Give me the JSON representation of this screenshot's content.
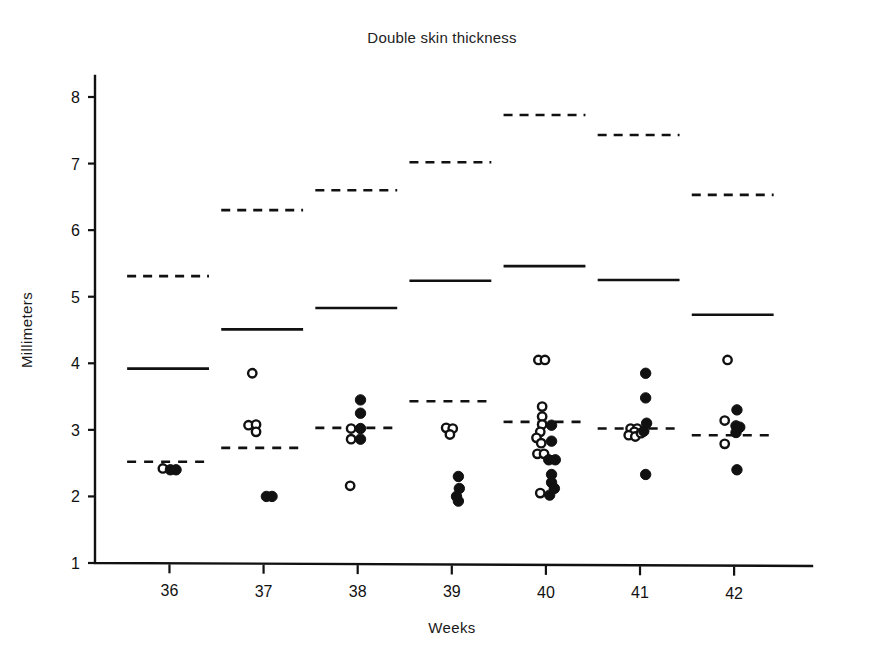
{
  "chart_data": {
    "type": "scatter",
    "title": "Double skin thickness",
    "xlabel": "Weeks",
    "ylabel": "Millimeters",
    "xlim": [
      35.4,
      42.7
    ],
    "ylim": [
      1,
      8.4
    ],
    "grid": false,
    "legend": "none",
    "x_ticks": [
      36,
      37,
      38,
      39,
      40,
      41,
      42
    ],
    "x_tick_labels": [
      "36",
      "37",
      "38",
      "39",
      "40",
      "41",
      "42"
    ],
    "y_ticks": [
      1,
      2,
      3,
      4,
      5,
      6,
      7,
      8
    ],
    "y_tick_labels": [
      "1",
      "2",
      "3",
      "4",
      "5",
      "6",
      "7",
      "8"
    ],
    "marker_types": [
      "open-circle",
      "filled-circle"
    ],
    "series": [
      {
        "name": "open-circle",
        "marker": "open-circle",
        "points": [
          {
            "week": 36,
            "x": 35.93,
            "y": 2.42
          },
          {
            "week": 37,
            "x": 36.88,
            "y": 3.85
          },
          {
            "week": 37,
            "x": 36.84,
            "y": 3.07
          },
          {
            "week": 37,
            "x": 36.92,
            "y": 3.08
          },
          {
            "week": 37,
            "x": 36.92,
            "y": 2.97
          },
          {
            "week": 38,
            "x": 37.93,
            "y": 3.02
          },
          {
            "week": 38,
            "x": 37.93,
            "y": 2.86
          },
          {
            "week": 38,
            "x": 37.92,
            "y": 2.16
          },
          {
            "week": 39,
            "x": 38.94,
            "y": 3.03
          },
          {
            "week": 39,
            "x": 39.01,
            "y": 3.02
          },
          {
            "week": 39,
            "x": 38.98,
            "y": 2.93
          },
          {
            "week": 40,
            "x": 39.92,
            "y": 4.05
          },
          {
            "week": 40,
            "x": 39.99,
            "y": 4.05
          },
          {
            "week": 40,
            "x": 39.96,
            "y": 3.35
          },
          {
            "week": 40,
            "x": 39.96,
            "y": 3.2
          },
          {
            "week": 40,
            "x": 39.96,
            "y": 3.08
          },
          {
            "week": 40,
            "x": 39.94,
            "y": 2.97
          },
          {
            "week": 40,
            "x": 39.9,
            "y": 2.88
          },
          {
            "week": 40,
            "x": 39.95,
            "y": 2.8
          },
          {
            "week": 40,
            "x": 39.91,
            "y": 2.64
          },
          {
            "week": 40,
            "x": 39.98,
            "y": 2.64
          },
          {
            "week": 40,
            "x": 39.94,
            "y": 2.05
          },
          {
            "week": 41,
            "x": 40.9,
            "y": 3.02
          },
          {
            "week": 41,
            "x": 40.97,
            "y": 3.02
          },
          {
            "week": 41,
            "x": 40.94,
            "y": 2.97
          },
          {
            "week": 41,
            "x": 40.88,
            "y": 2.92
          },
          {
            "week": 41,
            "x": 40.95,
            "y": 2.9
          },
          {
            "week": 41,
            "x": 41.01,
            "y": 2.95
          },
          {
            "week": 42,
            "x": 41.93,
            "y": 4.05
          },
          {
            "week": 42,
            "x": 41.9,
            "y": 3.14
          },
          {
            "week": 42,
            "x": 41.9,
            "y": 2.79
          }
        ]
      },
      {
        "name": "filled-circle",
        "marker": "filled-circle",
        "points": [
          {
            "week": 36,
            "x": 36.01,
            "y": 2.4
          },
          {
            "week": 36,
            "x": 36.07,
            "y": 2.4
          },
          {
            "week": 37,
            "x": 37.03,
            "y": 2.0
          },
          {
            "week": 37,
            "x": 37.09,
            "y": 2.0
          },
          {
            "week": 38,
            "x": 38.03,
            "y": 3.45
          },
          {
            "week": 38,
            "x": 38.03,
            "y": 3.25
          },
          {
            "week": 38,
            "x": 38.03,
            "y": 3.02
          },
          {
            "week": 38,
            "x": 38.03,
            "y": 2.86
          },
          {
            "week": 39,
            "x": 39.07,
            "y": 2.3
          },
          {
            "week": 39,
            "x": 39.08,
            "y": 2.12
          },
          {
            "week": 39,
            "x": 39.05,
            "y": 2.0
          },
          {
            "week": 39,
            "x": 39.07,
            "y": 1.93
          },
          {
            "week": 40,
            "x": 40.06,
            "y": 3.07
          },
          {
            "week": 40,
            "x": 40.06,
            "y": 2.83
          },
          {
            "week": 40,
            "x": 40.03,
            "y": 2.55
          },
          {
            "week": 40,
            "x": 40.1,
            "y": 2.55
          },
          {
            "week": 40,
            "x": 40.06,
            "y": 2.33
          },
          {
            "week": 40,
            "x": 40.06,
            "y": 2.21
          },
          {
            "week": 40,
            "x": 40.09,
            "y": 2.12
          },
          {
            "week": 40,
            "x": 40.04,
            "y": 2.02
          },
          {
            "week": 41,
            "x": 41.06,
            "y": 3.85
          },
          {
            "week": 41,
            "x": 41.06,
            "y": 3.48
          },
          {
            "week": 41,
            "x": 41.07,
            "y": 3.1
          },
          {
            "week": 41,
            "x": 41.04,
            "y": 2.98
          },
          {
            "week": 41,
            "x": 41.06,
            "y": 2.33
          },
          {
            "week": 42,
            "x": 42.03,
            "y": 3.3
          },
          {
            "week": 42,
            "x": 42.02,
            "y": 3.06
          },
          {
            "week": 42,
            "x": 42.06,
            "y": 3.04
          },
          {
            "week": 42,
            "x": 42.02,
            "y": 2.96
          },
          {
            "week": 42,
            "x": 42.03,
            "y": 2.4
          }
        ]
      }
    ],
    "reference_lines": [
      {
        "name": "upper-dashed",
        "style": "dashed",
        "segments": [
          {
            "week": 36,
            "x0": 35.55,
            "x1": 36.42,
            "y": 5.31
          },
          {
            "week": 37,
            "x0": 36.55,
            "x1": 37.42,
            "y": 6.3
          },
          {
            "week": 38,
            "x0": 37.55,
            "x1": 38.42,
            "y": 6.6
          },
          {
            "week": 39,
            "x0": 38.55,
            "x1": 39.42,
            "y": 7.02
          },
          {
            "week": 40,
            "x0": 39.55,
            "x1": 40.42,
            "y": 7.73
          },
          {
            "week": 41,
            "x0": 40.55,
            "x1": 41.42,
            "y": 7.43
          },
          {
            "week": 42,
            "x0": 41.55,
            "x1": 42.42,
            "y": 6.53
          }
        ]
      },
      {
        "name": "upper-solid",
        "style": "solid",
        "segments": [
          {
            "week": 36,
            "x0": 35.55,
            "x1": 36.42,
            "y": 3.92
          },
          {
            "week": 37,
            "x0": 36.55,
            "x1": 37.42,
            "y": 4.51
          },
          {
            "week": 38,
            "x0": 37.55,
            "x1": 38.42,
            "y": 4.83
          },
          {
            "week": 39,
            "x0": 38.55,
            "x1": 39.42,
            "y": 5.24
          },
          {
            "week": 40,
            "x0": 39.55,
            "x1": 40.42,
            "y": 5.46
          },
          {
            "week": 41,
            "x0": 40.55,
            "x1": 41.42,
            "y": 5.25
          },
          {
            "week": 42,
            "x0": 41.55,
            "x1": 42.42,
            "y": 4.73
          }
        ]
      },
      {
        "name": "lower-dashed-mean",
        "style": "dashed",
        "segments": [
          {
            "week": 36,
            "x0": 35.55,
            "x1": 36.42,
            "y": 2.52
          },
          {
            "week": 37,
            "x0": 36.55,
            "x1": 37.42,
            "y": 2.73
          },
          {
            "week": 38,
            "x0": 37.55,
            "x1": 38.42,
            "y": 3.03
          },
          {
            "week": 39,
            "x0": 38.55,
            "x1": 39.42,
            "y": 3.43
          },
          {
            "week": 40,
            "x0": 39.55,
            "x1": 40.42,
            "y": 3.12
          },
          {
            "week": 41,
            "x0": 40.55,
            "x1": 41.42,
            "y": 3.02
          },
          {
            "week": 42,
            "x0": 41.55,
            "x1": 42.42,
            "y": 2.92
          }
        ]
      }
    ]
  }
}
